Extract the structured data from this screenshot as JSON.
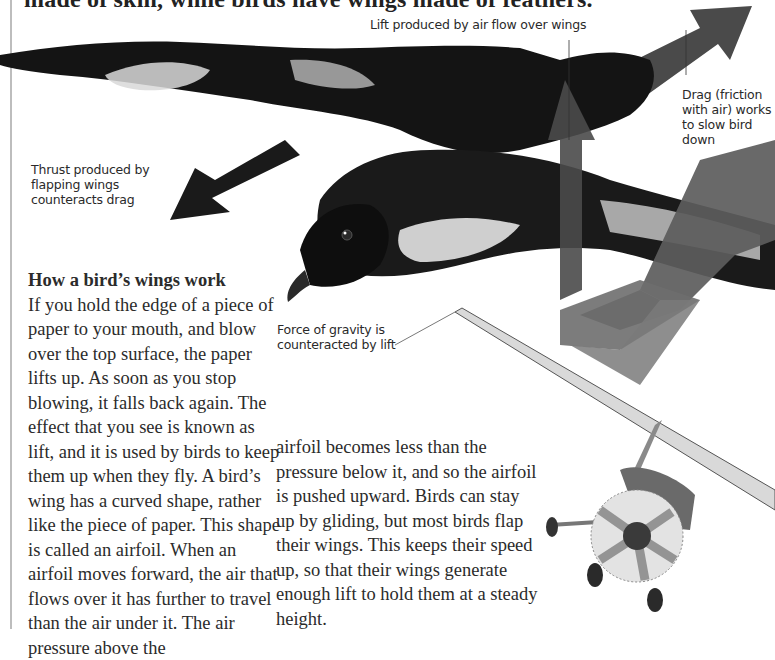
{
  "headline": "made of skin, while birds have wings made of feathers.",
  "captions": {
    "lift": "Lift produced by air flow over wings",
    "drag": "Drag (friction with air) works to slow bird down",
    "thrust": "Thrust produced by flapping wings counteracts drag",
    "gravity": "Force of gravity is counteracted by lift"
  },
  "section": {
    "heading": "How a bird’s wings work",
    "body_left": "If you hold the edge of a piece of paper to your mouth, and blow over the top surface, the paper lifts up. As soon as you stop blowing, it falls back again. The effect that you see is known as lift, and it is used by birds to keep them up when they fly. A bird’s wing has a curved shape, rather like the piece of paper. This shape is called an airfoil. When an airfoil moves forward, the air that flows over it has further to travel than the air under it. The air pressure above the",
    "body_right": "airfoil becomes less than the pressure below it, and so the airfoil is pushed upward. Birds can stay up by gliding, but most birds flap their wings. This keeps their speed up, so that their wings generate enough lift to hold them at a steady height."
  },
  "illustration": {
    "subjects": [
      "bird-in-flight",
      "light-aircraft"
    ],
    "arrows": [
      "lift-arrow",
      "drag-arrow",
      "thrust-arrow",
      "gravity-arrow"
    ],
    "colors": {
      "arrow_dark": "#4a4a4a",
      "arrow_mid": "#5c5c5c",
      "arrow_light": "#6e6e6e",
      "thrust_arrow": "#1a1a1a",
      "bird_dark": "#141414",
      "bird_light": "#d8d8d8",
      "page_rule": "#bdbdbd"
    }
  }
}
